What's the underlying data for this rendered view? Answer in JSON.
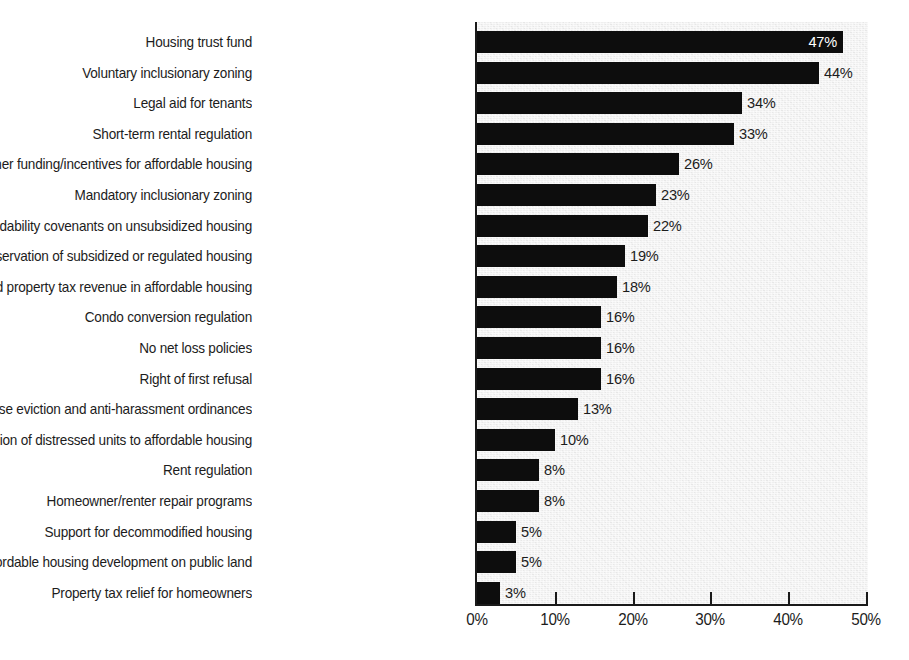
{
  "chart_data": {
    "type": "bar",
    "orientation": "horizontal",
    "title": "",
    "subtitle": "",
    "xlabel": "",
    "ylabel": "",
    "xlim": [
      0,
      50
    ],
    "xtick_suffix": "%",
    "grid": false,
    "legend": null,
    "value_label_suffix": "%",
    "axis": {
      "ticks": [
        0,
        10,
        20,
        30,
        40,
        50
      ],
      "tick_labels": [
        "0%",
        "10%",
        "20%",
        "30%",
        "40%",
        "50%"
      ]
    },
    "categories": [
      "Housing trust fund",
      "Voluntary inclusionary zoning",
      "Legal aid for tenants",
      "Short-term rental regulation",
      "Other funding/incentives for affordable housing",
      "Mandatory inclusionary zoning",
      "Establishing affordability covenants on unsubsidized housing",
      "Preservation of subsidized or regulated housing",
      "Reinvesting increased property tax revenue in affordable housing",
      "Condo conversion regulation",
      "No net loss policies",
      "Right of first refusal",
      "Just cause eviction and anti-harassment ordinances",
      "Conversion of distressed units to affordable housing",
      "Rent regulation",
      "Homeowner/renter repair programs",
      "Support for decommodified housing",
      "Affordable housing development on public land",
      "Property tax relief for homeowners"
    ],
    "values": [
      47,
      44,
      34,
      33,
      26,
      23,
      22,
      19,
      18,
      16,
      16,
      16,
      13,
      10,
      8,
      8,
      5,
      5,
      3
    ],
    "value_labels": [
      "47%",
      "44%",
      "34%",
      "33%",
      "26%",
      "23%",
      "22%",
      "19%",
      "18%",
      "16%",
      "16%",
      "16%",
      "13%",
      "10%",
      "8%",
      "8%",
      "5%",
      "5%",
      "3%"
    ],
    "label_placement": [
      "inside",
      "outside",
      "outside",
      "outside",
      "outside",
      "outside",
      "outside",
      "outside",
      "outside",
      "outside",
      "outside",
      "outside",
      "outside",
      "outside",
      "outside",
      "outside",
      "outside",
      "outside",
      "outside"
    ],
    "colors": {
      "bar": "#0d0d0d",
      "plot_background": "#efefef",
      "page_background": "#ffffff",
      "text": "#1c1c1c",
      "inside_label_text": "#ffffff",
      "axis_line": "#1a1a1a"
    }
  }
}
